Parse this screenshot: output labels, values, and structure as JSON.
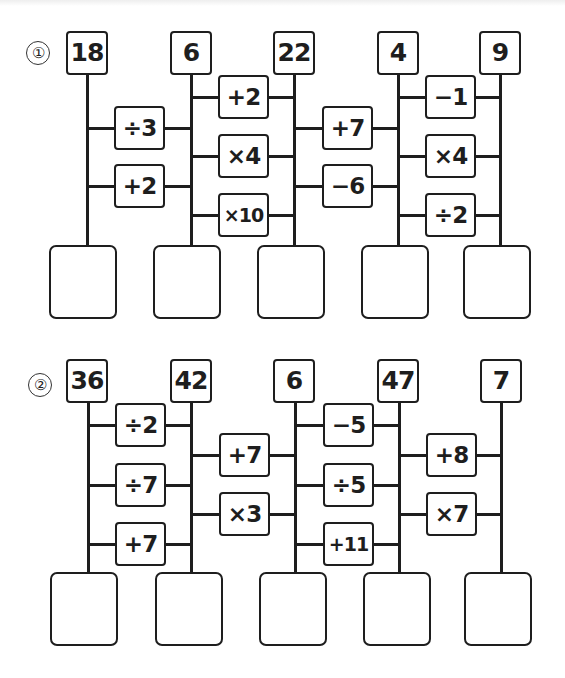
{
  "puzzles": [
    {
      "marker": "1",
      "start_values": [
        "18",
        "6",
        "22",
        "4",
        "9"
      ],
      "operations": [
        {
          "between": [
            0,
            1
          ],
          "labels": [
            "÷3",
            "+2"
          ]
        },
        {
          "between": [
            1,
            2
          ],
          "labels": [
            "+2",
            "×4",
            "×10"
          ]
        },
        {
          "between": [
            2,
            3
          ],
          "labels": [
            "+7",
            "−6"
          ]
        },
        {
          "between": [
            3,
            4
          ],
          "labels": [
            "−1",
            "×4",
            "÷2"
          ]
        }
      ],
      "answers": [
        "",
        "",
        "",
        "",
        ""
      ]
    },
    {
      "marker": "2",
      "start_values": [
        "36",
        "42",
        "6",
        "47",
        "7"
      ],
      "operations": [
        {
          "between": [
            0,
            1
          ],
          "labels": [
            "÷2",
            "÷7",
            "+7"
          ]
        },
        {
          "between": [
            1,
            2
          ],
          "labels": [
            "+7",
            "×3"
          ]
        },
        {
          "between": [
            2,
            3
          ],
          "labels": [
            "−5",
            "÷5",
            "+11"
          ]
        },
        {
          "between": [
            3,
            4
          ],
          "labels": [
            "+8",
            "×7"
          ]
        }
      ],
      "answers": [
        "",
        "",
        "",
        "",
        ""
      ]
    }
  ],
  "markers": [
    "①",
    "②"
  ]
}
